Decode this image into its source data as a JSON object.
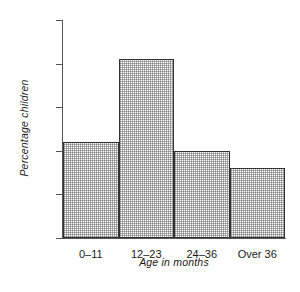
{
  "chart_data": {
    "type": "bar",
    "title": "",
    "subtitle": "",
    "xlabel": "Age in months",
    "ylabel": "Percentage children",
    "categories": [
      "0–11",
      "12–23",
      "24–36",
      "Over 36"
    ],
    "values": [
      22,
      41,
      20,
      16
    ],
    "series": [
      {
        "name": "Percentage children",
        "values": [
          22,
          41,
          20,
          16
        ]
      }
    ],
    "ylim": [
      0,
      50
    ],
    "yticks": [
      0,
      10,
      20,
      30,
      40,
      50
    ],
    "ytick_labels": [
      "0",
      "10",
      "20",
      "30",
      "40",
      "50"
    ],
    "grid": false,
    "legend": false,
    "legend_position": "none",
    "bar_gap": 0,
    "colors": {
      "bar_fill": "#ffffff",
      "bar_pattern": "#6e6e6e",
      "bar_edge": "#333333",
      "axis": "#555555",
      "text": "#1a1a1a",
      "background": "#ffffff"
    }
  }
}
